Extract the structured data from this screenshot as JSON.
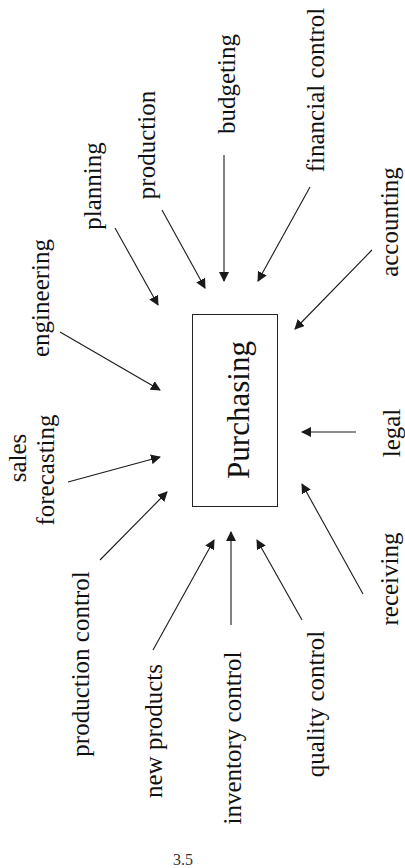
{
  "diagram": {
    "center": {
      "label": "Purchasing"
    },
    "inputs": {
      "engineering": "engineering",
      "sales_line1": "sales",
      "sales_line2": "forecasting",
      "planning": "planning",
      "production": "production",
      "budgeting": "budgeting",
      "financial_control": "financial control",
      "accounting": "accounting",
      "legal": "legal",
      "receiving": "receiving",
      "production_control": "production control",
      "new_products": "new products",
      "inventory_control": "inventory control",
      "quality_control": "quality control"
    },
    "figure_number": "3.5",
    "colors": {
      "line": "#1a1a1a",
      "text": "#111111",
      "background": "#ffffff"
    }
  }
}
